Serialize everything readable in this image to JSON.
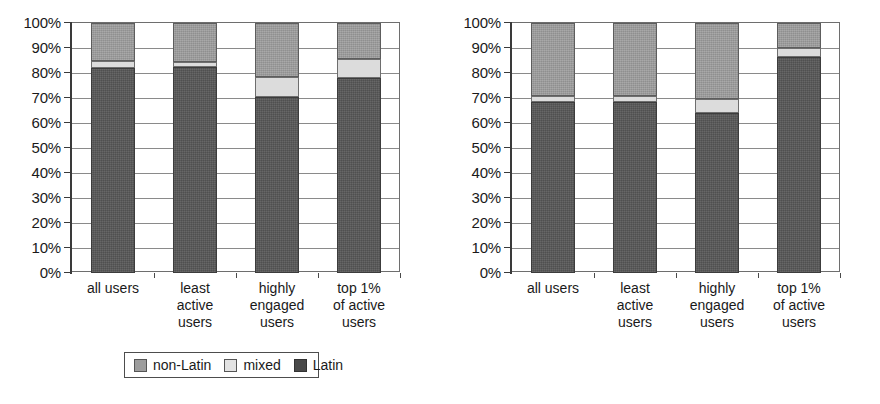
{
  "chart_data": [
    {
      "id": "left",
      "type": "bar",
      "subtype": "stacked-100-percent",
      "title": "",
      "xlabel": "",
      "ylabel": "",
      "ylim": [
        0,
        100
      ],
      "ytick_labels": [
        "100%",
        "90%",
        "80%",
        "70%",
        "60%",
        "50%",
        "40%",
        "30%",
        "20%",
        "10%",
        "0%"
      ],
      "ytick_values": [
        100,
        90,
        80,
        70,
        60,
        50,
        40,
        30,
        20,
        10,
        0
      ],
      "grid": true,
      "legend_position": "bottom",
      "categories": [
        "all users",
        "least\nactive\nusers",
        "highly\nengaged\nusers",
        "top 1%\nof active\nusers"
      ],
      "series": [
        {
          "name": "Latin",
          "color": "#575757",
          "values": [
            82,
            82.5,
            70.5,
            78
          ]
        },
        {
          "name": "mixed",
          "color": "#dcdcdc",
          "values": [
            3,
            2,
            8,
            7.5
          ]
        },
        {
          "name": "non-Latin",
          "color": "#9d9d9d",
          "values": [
            15,
            15.5,
            21.5,
            14.5
          ]
        }
      ]
    },
    {
      "id": "right",
      "type": "bar",
      "subtype": "stacked-100-percent",
      "title": "",
      "xlabel": "",
      "ylabel": "",
      "ylim": [
        0,
        100
      ],
      "ytick_labels": [
        "100%",
        "90%",
        "80%",
        "70%",
        "60%",
        "50%",
        "40%",
        "30%",
        "20%",
        "10%",
        "0%"
      ],
      "ytick_values": [
        100,
        90,
        80,
        70,
        60,
        50,
        40,
        30,
        20,
        10,
        0
      ],
      "grid": true,
      "legend_position": "bottom",
      "categories": [
        "all users",
        "least\nactive\nusers",
        "highly\nengaged\nusers",
        "top 1%\nof active\nusers"
      ],
      "series": [
        {
          "name": "Latin",
          "color": "#575757",
          "values": [
            68.5,
            68.5,
            64,
            86.5
          ]
        },
        {
          "name": "mixed",
          "color": "#dcdcdc",
          "values": [
            2.5,
            2.5,
            5.5,
            3.5
          ]
        },
        {
          "name": "non-Latin",
          "color": "#9d9d9d",
          "values": [
            29,
            29,
            30.5,
            10
          ]
        }
      ]
    }
  ],
  "legend": {
    "items": [
      {
        "label": "non-Latin",
        "swatch": "nonlatin"
      },
      {
        "label": "mixed",
        "swatch": "mixed"
      },
      {
        "label": "Latin",
        "swatch": "latin"
      }
    ]
  },
  "colors": {
    "non_latin": "#9d9d9d",
    "mixed": "#dcdcdc",
    "latin": "#575757",
    "axis": "#3a3a3a",
    "grid": "#8a8a8a"
  }
}
